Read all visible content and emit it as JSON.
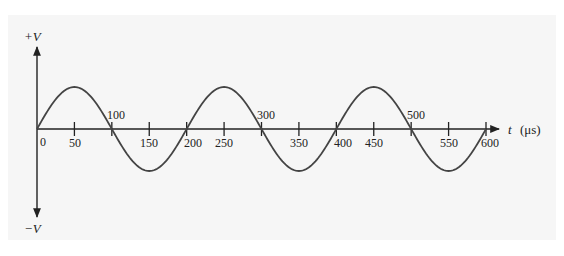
{
  "diagram": {
    "type": "waveform",
    "colors": {
      "background": "#ffffff",
      "panel": "#f6f6f6",
      "axis": "#222222",
      "wave": "#444444"
    },
    "y_axis": {
      "top_label": "+V",
      "bottom_label": "−V"
    },
    "x_axis": {
      "variable": "t",
      "unit": "(μs)",
      "origin_label": "0",
      "below_labels": [
        "50",
        "150",
        "200",
        "250",
        "350",
        "400",
        "450",
        "550",
        "600"
      ],
      "above_labels": [
        "100",
        "300",
        "500"
      ]
    }
  },
  "chart_data": {
    "type": "line",
    "title": "",
    "xlabel": "t (μs)",
    "ylabel": "V",
    "x_ticks": [
      0,
      50,
      100,
      150,
      200,
      250,
      300,
      350,
      400,
      450,
      500,
      550,
      600
    ],
    "xlim": [
      0,
      600
    ],
    "ylim": [
      "-V",
      "+V"
    ],
    "series": [
      {
        "name": "sine voltage",
        "function": "V*sin(2*pi*t/200)",
        "period_us": 200,
        "cycles": 3,
        "x": [
          0,
          50,
          100,
          150,
          200,
          250,
          300,
          350,
          400,
          450,
          500,
          550,
          600
        ],
        "y": [
          0,
          1,
          0,
          -1,
          0,
          1,
          0,
          -1,
          0,
          1,
          0,
          -1,
          0
        ]
      }
    ],
    "grid": false,
    "legend": false
  }
}
